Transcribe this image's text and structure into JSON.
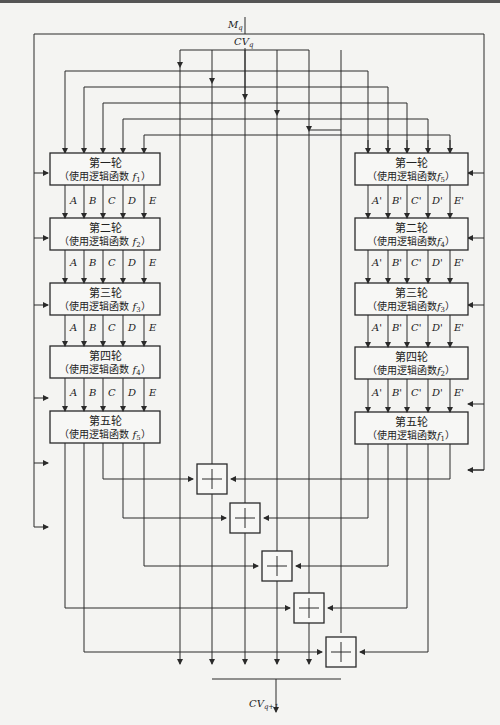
{
  "diagram": {
    "inputs": {
      "message": "M",
      "message_sub": "q",
      "chaining": "CV",
      "chaining_sub": "q"
    },
    "output": {
      "label": "CV",
      "label_sub": "q+1"
    },
    "left_line": {
      "rounds": [
        {
          "name": "第一轮",
          "func_prefix": "（使用逻辑函数 ",
          "func": "f",
          "func_sub": "1",
          "func_suffix": "）"
        },
        {
          "name": "第二轮",
          "func_prefix": "（使用逻辑函数 ",
          "func": "f",
          "func_sub": "2",
          "func_suffix": "）"
        },
        {
          "name": "第三轮",
          "func_prefix": "（使用逻辑函数 ",
          "func": "f",
          "func_sub": "3",
          "func_suffix": "）"
        },
        {
          "name": "第四轮",
          "func_prefix": "（使用逻辑函数 ",
          "func": "f",
          "func_sub": "4",
          "func_suffix": "）"
        },
        {
          "name": "第五轮",
          "func_prefix": "（使用逻辑函数 ",
          "func": "f",
          "func_sub": "5",
          "func_suffix": "）"
        }
      ],
      "registers": [
        "A",
        "B",
        "C",
        "D",
        "E"
      ]
    },
    "right_line": {
      "rounds": [
        {
          "name": "第一轮",
          "func_prefix": "（使用逻辑函数",
          "func": "f",
          "func_sub": "5",
          "func_suffix": "）"
        },
        {
          "name": "第二轮",
          "func_prefix": "（使用逻辑函数",
          "func": "f",
          "func_sub": "4",
          "func_suffix": "）"
        },
        {
          "name": "第三轮",
          "func_prefix": "（使用逻辑函数",
          "func": "f",
          "func_sub": "3",
          "func_suffix": "）"
        },
        {
          "name": "第四轮",
          "func_prefix": "（使用逻辑函数",
          "func": "f",
          "func_sub": "2",
          "func_suffix": "）"
        },
        {
          "name": "第五轮",
          "func_prefix": "（使用逻辑函数",
          "func": "f",
          "func_sub": "1",
          "func_suffix": "）"
        }
      ],
      "registers": [
        "A'",
        "B'",
        "C'",
        "D'",
        "E'"
      ]
    },
    "adders": 5
  }
}
